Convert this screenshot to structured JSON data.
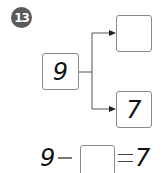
{
  "problem_number": "13",
  "number_bond": {
    "whole": "9",
    "part_top": "",
    "part_bottom": "7"
  },
  "equation": {
    "operand1": "9",
    "operator": "−",
    "operand2_blank": "",
    "equals": "=",
    "result": "7"
  },
  "colors": {
    "badge": "#5a5a5a",
    "box_border": "#8a8a8a",
    "line": "#555555",
    "text": "#111111"
  }
}
